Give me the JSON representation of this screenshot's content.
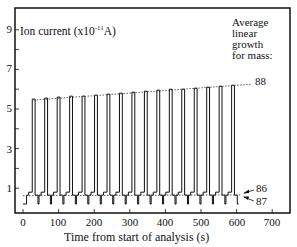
{
  "chart_data": {
    "type": "line",
    "title": "",
    "ylabel": "Ion current (x10^-11 A)",
    "ylabel_parts": {
      "base": "Ion current (x10",
      "exp": "-11",
      "unit": "A)"
    },
    "xlabel": "Time from start of analysis (s)",
    "xlim": [
      -20,
      750
    ],
    "ylim": [
      -0.2,
      10
    ],
    "x_ticks": [
      0,
      100,
      200,
      300,
      400,
      500,
      600,
      700
    ],
    "y_ticks_labeled": [
      1,
      3,
      5,
      7,
      9
    ],
    "y_ticks_minor": [
      2,
      4,
      6,
      8
    ],
    "grid": false,
    "legend_title": "Average linear growth for mass:",
    "legend_lines": [
      "Average",
      "linear",
      "growth",
      "for mass:"
    ],
    "series": [
      {
        "name": "88",
        "description": "peak tops (dotted linear fit)",
        "x": [
          30,
          65,
          100,
          135,
          170,
          205,
          240,
          275,
          310,
          345,
          380,
          415,
          450,
          485,
          520,
          555,
          590
        ],
        "values": [
          5.5,
          5.55,
          5.6,
          5.65,
          5.65,
          5.7,
          5.75,
          5.8,
          5.85,
          5.9,
          5.95,
          6.0,
          6.0,
          6.05,
          6.1,
          6.15,
          6.2
        ],
        "fit": {
          "x": [
            30,
            640
          ],
          "y": [
            5.45,
            6.25
          ]
        }
      },
      {
        "name": "86",
        "description": "intermediate plateau",
        "level": 0.65,
        "fit": {
          "x": [
            0,
            610
          ],
          "y": [
            0.62,
            0.66
          ]
        }
      },
      {
        "name": "87",
        "description": "baseline",
        "level": 0.2
      }
    ],
    "annotations": [
      {
        "text": "88",
        "at": "end of dotted fit line"
      },
      {
        "text": "86",
        "arrow": true
      },
      {
        "text": "87",
        "arrow": true
      }
    ],
    "cycle_period_s": 35,
    "cycles": 17
  },
  "labels": {
    "ylabel_base": "Ion current (x10",
    "ylabel_exp": "-11",
    "ylabel_unit": "A)",
    "xlabel": "Time from start of analysis (s)",
    "legend_1": "Average",
    "legend_2": "linear",
    "legend_3": "growth",
    "legend_4": "for mass:",
    "mass_88": "88",
    "mass_86": "86",
    "mass_87": "87",
    "y9": "9",
    "y7": "7",
    "y5": "5",
    "y3": "3",
    "y1": "1",
    "x0": "0",
    "x100": "100",
    "x200": "200",
    "x300": "300",
    "x400": "400",
    "x500": "500",
    "x600": "600",
    "x700": "700"
  }
}
